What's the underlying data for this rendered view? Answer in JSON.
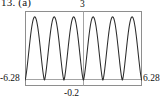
{
  "figure": {
    "exercise_number": "13.",
    "part_label": "(a)"
  },
  "axis_labels": {
    "y_max": "3",
    "y_min": "-0.2",
    "x_min": "-6.28",
    "x_max": "6.28"
  },
  "colors": {
    "curve": "#2b2b2b",
    "frame": "#8e8e8e",
    "axis": "#9a9a9a",
    "text": "#151515",
    "background": "#ffffff"
  },
  "chart_data": {
    "type": "line",
    "title": "",
    "xlabel": "",
    "ylabel": "",
    "xlim": [
      -6.28,
      6.28
    ],
    "ylim": [
      -0.2,
      3
    ],
    "grid": false,
    "legend": null,
    "annotations": [
      {
        "text": "3",
        "position": "top-center",
        "meaning": "y-axis maximum"
      },
      {
        "text": "-0.2",
        "position": "bottom-center",
        "meaning": "y-axis minimum"
      },
      {
        "text": "-6.28",
        "position": "left",
        "meaning": "x-axis minimum"
      },
      {
        "text": "6.28",
        "position": "right",
        "meaning": "x-axis maximum"
      }
    ],
    "axes_drawn": {
      "x_axis_at_y": 0,
      "y_axis_at_x": 0
    },
    "series": [
      {
        "name": "curve",
        "peaks_x": [
          -5.23,
          -3.14,
          -1.05,
          1.05,
          3.14,
          5.23
        ],
        "peak_value": 2.75,
        "troughs_x": [
          -6.28,
          -4.19,
          -2.09,
          0.0,
          2.09,
          4.19,
          6.28
        ],
        "trough_value": 0.05,
        "period": 2.09,
        "x": [
          -6.28,
          -6.07,
          -5.86,
          -5.65,
          -5.44,
          -5.23,
          -5.02,
          -4.81,
          -4.6,
          -4.4,
          -4.19,
          -3.98,
          -3.77,
          -3.56,
          -3.35,
          -3.14,
          -2.93,
          -2.72,
          -2.51,
          -2.3,
          -2.09,
          -1.88,
          -1.67,
          -1.47,
          -1.26,
          -1.05,
          -0.84,
          -0.63,
          -0.42,
          -0.21,
          0.0,
          0.21,
          0.42,
          0.63,
          0.84,
          1.05,
          1.26,
          1.47,
          1.67,
          1.88,
          2.09,
          2.3,
          2.51,
          2.72,
          2.93,
          3.14,
          3.35,
          3.56,
          3.77,
          3.98,
          4.19,
          4.4,
          4.6,
          4.81,
          5.02,
          5.23,
          5.44,
          5.65,
          5.86,
          6.07,
          6.28
        ],
        "y": [
          0.05,
          0.32,
          1.03,
          1.93,
          2.58,
          2.75,
          2.58,
          1.93,
          1.03,
          0.32,
          0.05,
          0.32,
          1.03,
          1.93,
          2.58,
          2.75,
          2.58,
          1.93,
          1.03,
          0.32,
          0.05,
          0.32,
          1.03,
          1.93,
          2.58,
          2.75,
          2.58,
          1.93,
          1.03,
          0.32,
          0.05,
          0.32,
          1.03,
          1.93,
          2.58,
          2.75,
          2.58,
          1.93,
          1.03,
          0.32,
          0.05,
          0.32,
          1.03,
          1.93,
          2.58,
          2.75,
          2.58,
          1.93,
          1.03,
          0.32,
          0.05,
          0.32,
          1.03,
          1.93,
          2.58,
          2.75,
          2.58,
          1.93,
          1.03,
          0.32,
          0.05
        ]
      }
    ]
  }
}
